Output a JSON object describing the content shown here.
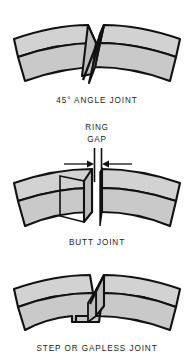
{
  "figure": {
    "background_color": "#ffffff",
    "outline_color": "#111111",
    "ring_fill_top": "#d2d2d2",
    "ring_fill_bottom": "#c9c9c9",
    "ring_fill_face": "#bdbdbd",
    "text_color": "#1c1c1c"
  },
  "panels": [
    {
      "id": "angle-joint",
      "caption": "45° ANGLE JOINT",
      "caption_x": 97,
      "caption_y": 103,
      "joint_style": "diagonal-angled-cut"
    },
    {
      "id": "butt-joint",
      "caption": "BUTT JOINT",
      "caption_x": 97,
      "caption_y": 245,
      "joint_style": "square-butt-with-gap",
      "annotations": [
        {
          "name": "ring-gap-label-line1",
          "text": "RING",
          "x": 97,
          "y": 130
        },
        {
          "name": "ring-gap-label-line2",
          "text": "GAP",
          "x": 97,
          "y": 142
        }
      ]
    },
    {
      "id": "step-joint",
      "caption": "STEP OR GAPLESS JOINT",
      "caption_x": 97,
      "caption_y": 351,
      "joint_style": "interlocking-step"
    }
  ]
}
